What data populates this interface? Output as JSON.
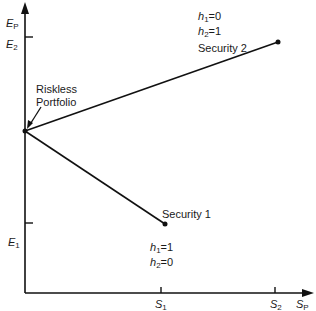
{
  "diagram": {
    "axes": {
      "y_label": "E",
      "y_label_sub": "P",
      "x_label": "S",
      "x_label_sub": "P",
      "y_ticks": [
        {
          "label": "E",
          "sub": "2"
        },
        {
          "label": "E",
          "sub": "1"
        }
      ],
      "x_ticks": [
        {
          "label": "S",
          "sub": "1"
        },
        {
          "label": "S",
          "sub": "2"
        }
      ]
    },
    "points": {
      "riskless": {
        "label_line1": "Riskless",
        "label_line2": "Portfolio"
      },
      "security1": {
        "label": "Security 1",
        "h1": "h",
        "h1_sub": "1",
        "h1_val": "=1",
        "h2": "h",
        "h2_sub": "2",
        "h2_val": "=0"
      },
      "security2": {
        "label": "Security 2",
        "h1": "h",
        "h1_sub": "1",
        "h1_val": "=0",
        "h2": "h",
        "h2_sub": "2",
        "h2_val": "=1"
      }
    }
  }
}
